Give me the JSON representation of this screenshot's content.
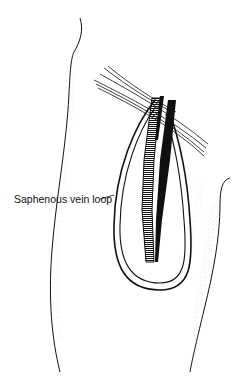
{
  "figure": {
    "labels": [
      {
        "text": "Saphenous vein loop",
        "target": "vein-loop"
      }
    ]
  },
  "colors": {
    "ink": "#111111",
    "background": "#ffffff",
    "stipple": "#888888"
  }
}
